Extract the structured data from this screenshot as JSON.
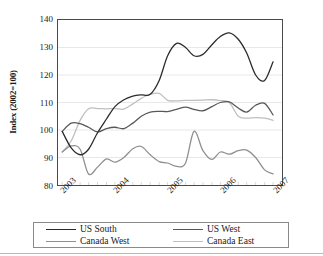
{
  "chart_data": {
    "type": "line",
    "title": "",
    "xlabel": "",
    "ylabel": "Index (2002=100)",
    "ylim": [
      80,
      140
    ],
    "yticks": [
      80,
      90,
      100,
      110,
      120,
      130,
      140
    ],
    "xticks": [
      "2003",
      "2004",
      "2005",
      "2006",
      "2007"
    ],
    "xlim": [
      2002.75,
      2007.0
    ],
    "grid": "horizontal",
    "legend_position": "bottom",
    "colors": {
      "us_south": "#2b2b2b",
      "us_west": "#585858",
      "canada_west": "#8f8f8f",
      "canada_east": "#bfbfbf"
    },
    "x": [
      2002.83,
      2003.0,
      2003.17,
      2003.33,
      2003.5,
      2003.67,
      2003.83,
      2004.0,
      2004.17,
      2004.33,
      2004.5,
      2004.67,
      2004.83,
      2005.0,
      2005.17,
      2005.33,
      2005.5,
      2005.67,
      2005.83,
      2006.0,
      2006.17,
      2006.33,
      2006.5,
      2006.67,
      2006.83
    ],
    "series": [
      {
        "name": "US South",
        "color": "#2b2b2b",
        "values": [
          99.5,
          93.5,
          91.0,
          93.0,
          99.0,
          104.0,
          108.5,
          111.0,
          112.3,
          112.8,
          113.0,
          118.0,
          127.0,
          131.5,
          130.0,
          127.0,
          127.5,
          131.0,
          134.0,
          135.3,
          133.0,
          128.0,
          120.0,
          118.0,
          124.8
        ]
      },
      {
        "name": "US West",
        "color": "#585858",
        "values": [
          99.5,
          102.5,
          102.3,
          101.0,
          99.3,
          100.5,
          101.0,
          100.5,
          102.5,
          105.0,
          106.5,
          106.8,
          106.7,
          107.5,
          108.3,
          107.5,
          107.0,
          108.5,
          110.0,
          110.2,
          108.0,
          106.5,
          109.0,
          109.7,
          105.5
        ]
      },
      {
        "name": "Canada West",
        "color": "#8f8f8f",
        "values": [
          92.0,
          94.2,
          93.0,
          84.0,
          86.5,
          89.5,
          88.3,
          90.0,
          93.2,
          94.0,
          91.0,
          88.5,
          88.0,
          86.8,
          88.0,
          99.5,
          92.5,
          89.3,
          92.0,
          91.2,
          92.5,
          92.7,
          90.0,
          85.5,
          84.0
        ]
      },
      {
        "name": "Canada East",
        "color": "#bfbfbf",
        "values": [
          92.0,
          96.0,
          103.5,
          107.7,
          107.8,
          107.7,
          107.8,
          107.6,
          109.5,
          111.5,
          113.0,
          113.3,
          110.8,
          110.6,
          110.8,
          110.8,
          110.9,
          111.0,
          110.7,
          110.0,
          105.0,
          104.3,
          104.5,
          104.3,
          103.5
        ]
      }
    ]
  },
  "axis": {
    "ylabel": "Index (2002=100)"
  },
  "legend": {
    "items": [
      {
        "label": "US South",
        "color": "#2b2b2b"
      },
      {
        "label": "US West",
        "color": "#585858"
      },
      {
        "label": "Canada West",
        "color": "#8f8f8f"
      },
      {
        "label": "Canada East",
        "color": "#bfbfbf"
      }
    ]
  }
}
